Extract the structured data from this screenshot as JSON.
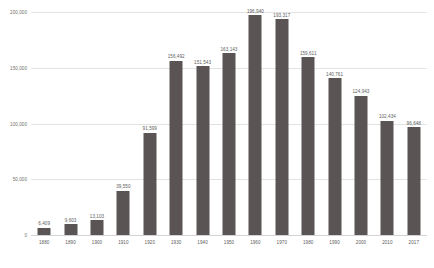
{
  "chart_data": {
    "type": "bar",
    "title": "",
    "subtitle": "",
    "xlabel": "",
    "ylabel": "",
    "categories": [
      "1880",
      "1890",
      "1900",
      "1910",
      "1920",
      "1930",
      "1940",
      "1950",
      "1960",
      "1970",
      "1980",
      "1990",
      "2000",
      "2010",
      "2017"
    ],
    "values": [
      6409,
      9603,
      13103,
      39550,
      91599,
      156492,
      151543,
      163143,
      196940,
      193317,
      159611,
      140761,
      124943,
      102434,
      96648
    ],
    "value_labels": [
      "6,409",
      "9,603",
      "13,103",
      "39,550",
      "91,599",
      "156,492",
      "151,543",
      "163,143",
      "196,940",
      "193,317",
      "159,611",
      "140,761",
      "124,943",
      "102,434",
      "96,648"
    ],
    "ylim": [
      0,
      200000
    ],
    "yticks": [
      0,
      50000,
      100000,
      150000,
      200000
    ],
    "ytick_labels": [
      "0",
      "50,000",
      "100,000",
      "150,000",
      "200,000"
    ],
    "grid": true,
    "legend": null,
    "series": [
      {
        "name": "",
        "color": "#5b5454",
        "values": [
          6409,
          9603,
          13103,
          39550,
          91599,
          156492,
          151543,
          163143,
          196940,
          193317,
          159611,
          140761,
          124943,
          102434,
          96648
        ]
      }
    ]
  },
  "style": {
    "bar_color": "#5b5454",
    "grid_color": "#e2e2e2",
    "text_color": "#5d5d5d",
    "background": "#ffffff"
  }
}
